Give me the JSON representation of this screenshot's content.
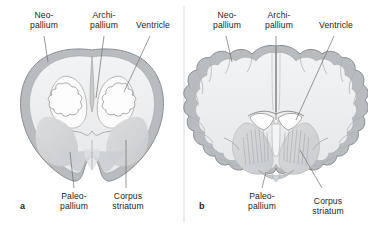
{
  "figure": {
    "type": "anatomical-diagram",
    "divider": true,
    "panels": [
      {
        "letter": "a",
        "name": "embryonic-brain-coronal-section",
        "labels": [
          "Neo-\npallium",
          "Archi-\npallium",
          "Ventricle",
          "Paleo-\npallium",
          "Corpus\nstriatum"
        ]
      },
      {
        "letter": "b",
        "name": "mature-brain-coronal-section",
        "labels": [
          "Neo-\npallium",
          "Archi-\npallium",
          "Ventricle",
          "Paleo-\npallium",
          "Corpus\nstriatum"
        ]
      }
    ]
  },
  "labels": {
    "neopallium": "Neo-\npallium",
    "archipallium": "Archi-\npallium",
    "ventricle": "Ventricle",
    "paleopallium": "Paleo-\npallium",
    "corpus_striatum": "Corpus\nstriatum"
  },
  "panel_letters": {
    "a": "a",
    "b": "b"
  },
  "colors": {
    "outline": "#8c8c8c",
    "cortex_rim": "#b9bcbe",
    "white_matter": "#eeeff0",
    "striatum": "#d5d7d9",
    "striatum_dark": "#c6c9cb",
    "leader_line": "#6f6f6f",
    "text": "#231f20",
    "background": "#ffffff",
    "divider": "#c9c9c9"
  }
}
